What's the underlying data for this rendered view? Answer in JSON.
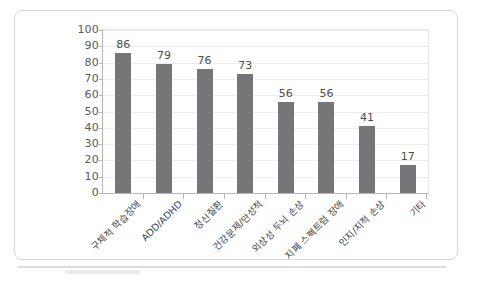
{
  "chart_data": {
    "type": "bar",
    "title": "",
    "subtitle": "",
    "xlabel": "",
    "ylabel": "",
    "ylim": [
      0,
      100
    ],
    "ytick_step": 10,
    "yticks": [
      "100",
      "90",
      "80",
      "70",
      "60",
      "50",
      "40",
      "30",
      "20",
      "10",
      "0"
    ],
    "grid": true,
    "legend": "none",
    "orientation": "vertical",
    "categories": [
      "구체적 학습장애",
      "ADD/ADHD",
      "정신질환",
      "건강문제/만성적",
      "외상성 두뇌 손상",
      "지폐 스펙트럼 장애",
      "인지/지적 손상",
      "기타"
    ],
    "values": [
      86,
      79,
      76,
      73,
      56,
      56,
      41,
      17
    ],
    "data_labels": [
      "86",
      "79",
      "76",
      "73",
      "56",
      "56",
      "41",
      "17"
    ],
    "series": [
      {
        "name": "",
        "values": [
          86,
          79,
          76,
          73,
          56,
          56,
          41,
          17
        ]
      }
    ],
    "colors": {
      "bar": "#767679",
      "gridline": "#ececec",
      "axis": "#b6b6b6",
      "tick_text": "#595959",
      "label_text": "#404040",
      "plot_background": "#ffffff",
      "card_border": "#d8d8d8"
    }
  }
}
